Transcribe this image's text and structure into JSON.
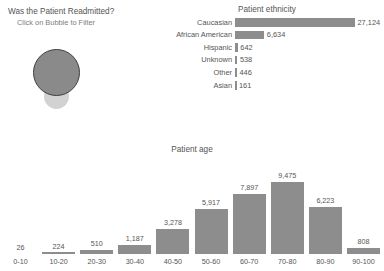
{
  "readmitted": {
    "title": "Was the Patient Readmitted?",
    "subtitle": "Click on Bubble to Filter",
    "bubbles": [
      {
        "name": "bubble-large",
        "color": "#8a8a8a",
        "border_color": "#3f3f3f"
      },
      {
        "name": "bubble-small",
        "color": "#d2d2d2"
      }
    ]
  },
  "ethnicity": {
    "title": "Patient ethnicity"
  },
  "age": {
    "title": "Patient age"
  },
  "colors": {
    "bar": "#8d8d8d",
    "text": "#555555",
    "background": "#ffffff"
  },
  "chart_data": [
    {
      "type": "bar",
      "orientation": "horizontal",
      "title": "Patient ethnicity",
      "xlabel": "",
      "ylabel": "",
      "grid": false,
      "legend": "none",
      "xlim": [
        0,
        27124
      ],
      "categories": [
        "Caucasian",
        "African American",
        "Hispanic",
        "Unknown",
        "Other",
        "Asian"
      ],
      "values": [
        27124,
        6634,
        642,
        538,
        446,
        161
      ],
      "value_labels": [
        "27,124",
        "6,634",
        "642",
        "538",
        "446",
        "161"
      ]
    },
    {
      "type": "bar",
      "orientation": "vertical",
      "title": "Patient age",
      "xlabel": "",
      "ylabel": "",
      "grid": false,
      "legend": "none",
      "ylim": [
        0,
        9475
      ],
      "categories": [
        "0-10",
        "10-20",
        "20-30",
        "30-40",
        "40-50",
        "50-60",
        "60-70",
        "70-80",
        "80-90",
        "90-100"
      ],
      "values": [
        26,
        224,
        510,
        1187,
        3278,
        5917,
        7897,
        9475,
        6223,
        808
      ],
      "value_labels": [
        "26",
        "224",
        "510",
        "1,187",
        "3,278",
        "5,917",
        "7,897",
        "9,475",
        "6,223",
        "808"
      ]
    }
  ]
}
